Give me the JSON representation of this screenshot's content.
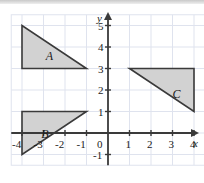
{
  "figure": {
    "type": "coordinate-grid-with-triangles",
    "axis_labels": {
      "x": "x",
      "y": "y"
    },
    "origin_label": "0",
    "x_ticks": [
      "-4",
      "-3",
      "-2",
      "-1",
      "1",
      "2",
      "3",
      "4"
    ],
    "y_ticks": [
      "5",
      "4",
      "3",
      "2",
      "1",
      "-1"
    ],
    "grid": {
      "x_min": -4.5,
      "x_max": 4.5,
      "y_min": -1.5,
      "y_max": 5.5,
      "cell": 1,
      "visible": true,
      "grid_color": "#dfe3ee",
      "axis_color": "#3a3a3a"
    },
    "shapes": [
      {
        "label": "A",
        "fill": "#d2d2d2",
        "stroke": "#3a3a3a",
        "vertices": [
          [
            -4,
            5
          ],
          [
            -4,
            3
          ],
          [
            -1,
            3
          ]
        ],
        "label_at": [
          -2.9,
          3.85
        ]
      },
      {
        "label": "B",
        "fill": "#d2d2d2",
        "stroke": "#3a3a3a",
        "vertices": [
          [
            -4,
            1
          ],
          [
            -1,
            1
          ],
          [
            -4,
            -1
          ]
        ],
        "label_at": [
          -3.1,
          0.25
        ]
      },
      {
        "label": "C",
        "fill": "#d2d2d2",
        "stroke": "#3a3a3a",
        "vertices": [
          [
            1,
            3
          ],
          [
            4,
            3
          ],
          [
            4,
            1
          ]
        ],
        "label_at": [
          3.0,
          2.1
        ]
      }
    ]
  },
  "ticklabels": {
    "x": [
      {
        "t": "-4",
        "v": -4
      },
      {
        "t": "-3",
        "v": -3
      },
      {
        "t": "-2",
        "v": -2
      },
      {
        "t": "-1",
        "v": -1
      },
      {
        "t": "1",
        "v": 1
      },
      {
        "t": "2",
        "v": 2
      },
      {
        "t": "3",
        "v": 3
      },
      {
        "t": "4",
        "v": 4
      }
    ],
    "y": [
      {
        "t": "5",
        "v": 5
      },
      {
        "t": "4",
        "v": 4
      },
      {
        "t": "3",
        "v": 3
      },
      {
        "t": "2",
        "v": 2
      },
      {
        "t": "1",
        "v": 1
      },
      {
        "t": "-1",
        "v": -1
      }
    ]
  },
  "chart_data": {
    "type": "scatter",
    "title": "",
    "xlabel": "x",
    "ylabel": "y",
    "xlim": [
      -4.5,
      4.5
    ],
    "ylim": [
      -1.5,
      5.5
    ],
    "grid": true,
    "legend": "none",
    "series": [
      {
        "name": "A",
        "points": [
          [
            -4,
            5
          ],
          [
            -4,
            3
          ],
          [
            -1,
            3
          ]
        ]
      },
      {
        "name": "B",
        "points": [
          [
            -4,
            1
          ],
          [
            -1,
            1
          ],
          [
            -4,
            -1
          ]
        ]
      },
      {
        "name": "C",
        "points": [
          [
            1,
            3
          ],
          [
            4,
            3
          ],
          [
            4,
            1
          ]
        ]
      }
    ]
  }
}
